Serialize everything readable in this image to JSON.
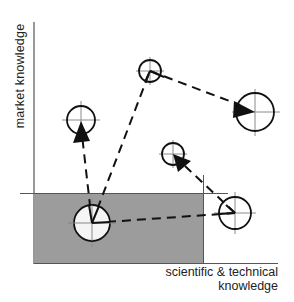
{
  "diagram": {
    "axes": {
      "y_label": "market knowledge",
      "x_label_line1": "scientific & technical",
      "x_label_line2": "knowledge"
    },
    "colors": {
      "shaded_region": "#9c9c9c",
      "line": "#111111",
      "crosshair": "#8a8a8a",
      "background": "#ffffff"
    },
    "nodes": [
      {
        "id": "origin",
        "cx": 92,
        "cy": 223,
        "r": 18
      },
      {
        "id": "upper-left",
        "cx": 81,
        "cy": 120,
        "r": 14
      },
      {
        "id": "top",
        "cx": 150,
        "cy": 71,
        "r": 11
      },
      {
        "id": "right",
        "cx": 255,
        "cy": 112,
        "r": 19
      },
      {
        "id": "middle",
        "cx": 173,
        "cy": 154,
        "r": 11
      },
      {
        "id": "lower-right",
        "cx": 235,
        "cy": 213,
        "r": 16
      }
    ],
    "paths": [
      {
        "from": "origin",
        "to": "upper-left",
        "arrow": true
      },
      {
        "from": "origin",
        "to": "top",
        "arrow": false
      },
      {
        "from": "top",
        "to": "right",
        "arrow": true
      },
      {
        "from": "origin",
        "to": "lower-right",
        "arrow": false
      },
      {
        "from": "lower-right",
        "to": "middle",
        "arrow": true
      }
    ]
  }
}
